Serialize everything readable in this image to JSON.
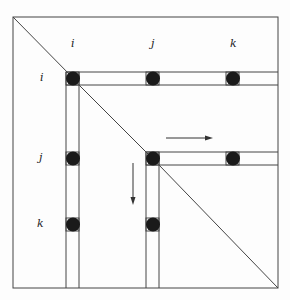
{
  "diagram": {
    "type": "matrix-elimination-schematic",
    "column_labels": [
      "i",
      "j",
      "k"
    ],
    "row_labels": [
      "i",
      "j",
      "k"
    ],
    "colors": {
      "line": "#444444",
      "dot": "#1a1a1a",
      "background": "#fdfdfd"
    },
    "arrows": [
      {
        "direction": "right"
      },
      {
        "direction": "down"
      }
    ],
    "dots": [
      {
        "row": "i",
        "col": "i"
      },
      {
        "row": "i",
        "col": "j"
      },
      {
        "row": "i",
        "col": "k"
      },
      {
        "row": "j",
        "col": "i"
      },
      {
        "row": "j",
        "col": "j"
      },
      {
        "row": "j",
        "col": "k"
      },
      {
        "row": "k",
        "col": "i"
      },
      {
        "row": "k",
        "col": "j"
      }
    ]
  }
}
